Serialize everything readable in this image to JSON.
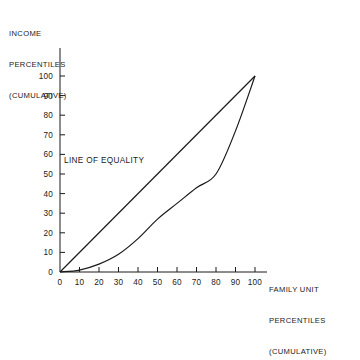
{
  "chart_data": {
    "type": "line",
    "title": "",
    "xlabel": "FAMILY UNIT PERCENTILES (CUMULATIVE)",
    "ylabel": "INCOME PERCENTILES (CUMULATIVE)",
    "xlabel_lines": [
      "FAMILY UNIT",
      "PERCENTILES",
      "(CUMULATIVE)"
    ],
    "ylabel_lines": [
      "INCOME",
      "PERCENTILES",
      "(CUMULATIVE)"
    ],
    "xlim": [
      0,
      100
    ],
    "ylim": [
      0,
      100
    ],
    "xticks": [
      0,
      10,
      20,
      30,
      40,
      50,
      60,
      70,
      80,
      90,
      100
    ],
    "yticks": [
      0,
      10,
      20,
      30,
      40,
      50,
      60,
      70,
      80,
      90,
      100
    ],
    "xticklabels": [
      "0",
      "10",
      "20",
      "30",
      "40",
      "50",
      "60",
      "70",
      "80",
      "90",
      "100"
    ],
    "yticklabels": [
      "0",
      "10",
      "20",
      "30",
      "40",
      "50",
      "60",
      "70",
      "80",
      "90",
      "100"
    ],
    "grid": false,
    "legend": "none",
    "line_color": "#1a1a1a",
    "background": "#ffffff",
    "series": [
      {
        "name": "LINE OF EQUALITY",
        "x": [
          0,
          100
        ],
        "values": [
          0,
          100
        ]
      },
      {
        "name": "Lorenz curve",
        "x": [
          0,
          10,
          20,
          30,
          40,
          50,
          60,
          70,
          80,
          90,
          100
        ],
        "values": [
          0,
          1,
          4,
          9,
          17,
          27,
          35,
          43,
          50,
          72,
          100
        ]
      }
    ],
    "annotations": [
      {
        "text": "LINE OF EQUALITY",
        "x": 0,
        "y": 57
      }
    ]
  }
}
